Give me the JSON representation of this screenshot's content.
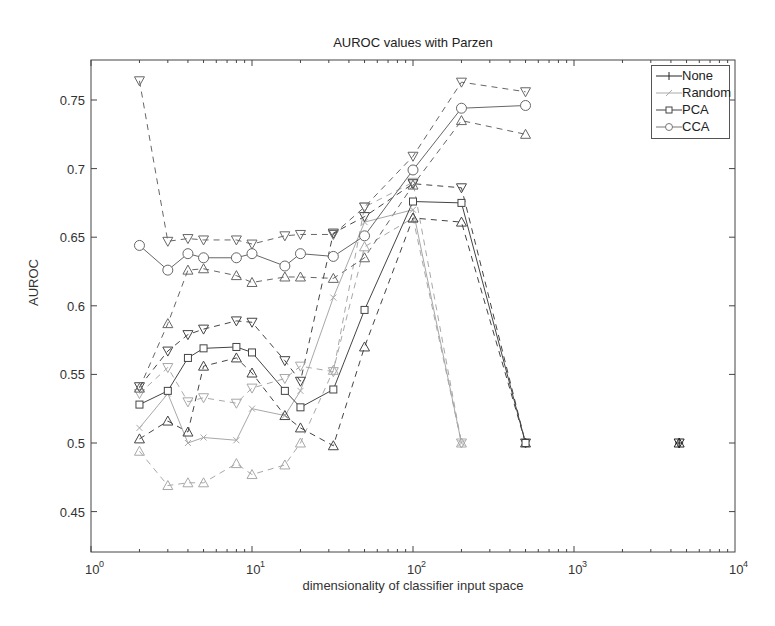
{
  "chart_data": {
    "type": "line",
    "title": "AUROC values with Parzen",
    "xlabel": "dimensionality of classifier input space",
    "ylabel": "AUROC",
    "xscale": "log",
    "xlim": [
      1,
      10000
    ],
    "ylim": [
      0.42,
      0.78
    ],
    "x_ticks": [
      1,
      10,
      100,
      1000,
      10000
    ],
    "x_tick_labels": [
      "10^0",
      "10^1",
      "10^2",
      "10^3",
      "10^4"
    ],
    "y_ticks": [
      0.45,
      0.5,
      0.55,
      0.6,
      0.65,
      0.7,
      0.75
    ],
    "y_tick_labels": [
      "0.45",
      "0.5",
      "0.55",
      "0.6",
      "0.65",
      "0.7",
      "0.75"
    ],
    "grid": false,
    "legend_position": "upper right",
    "band_style": "dashed lines; upper band marked with down-triangles, lower band with up-triangles",
    "series": [
      {
        "name": "None",
        "marker": "plus",
        "color": "#222222",
        "x": [
          4500
        ],
        "values": [
          0.5
        ],
        "upper": [
          0.5
        ],
        "lower": [
          0.5
        ]
      },
      {
        "name": "Random",
        "marker": "x",
        "color": "#a8a8a8",
        "x": [
          2,
          3,
          4,
          5,
          8,
          10,
          16,
          20,
          32,
          50,
          100,
          200
        ],
        "values": [
          0.511,
          0.536,
          0.5,
          0.504,
          0.502,
          0.525,
          0.52,
          0.538,
          0.606,
          0.661,
          0.67,
          0.5
        ],
        "upper": [
          0.536,
          0.555,
          0.53,
          0.533,
          0.529,
          0.54,
          0.547,
          0.556,
          0.552,
          0.672,
          0.69,
          0.5
        ],
        "lower": [
          0.494,
          0.469,
          0.471,
          0.471,
          0.485,
          0.477,
          0.484,
          0.5,
          0.553,
          0.643,
          0.664,
          0.5
        ]
      },
      {
        "name": "PCA",
        "marker": "square",
        "color": "#444444",
        "x": [
          2,
          3,
          4,
          5,
          8,
          10,
          16,
          20,
          32,
          50,
          100,
          200,
          500
        ],
        "values": [
          0.528,
          0.538,
          0.562,
          0.569,
          0.57,
          0.566,
          0.538,
          0.526,
          0.539,
          0.597,
          0.676,
          0.675,
          0.5
        ],
        "upper": [
          0.541,
          0.567,
          0.579,
          0.583,
          0.589,
          0.588,
          0.56,
          0.545,
          0.653,
          0.665,
          0.689,
          0.686,
          0.5
        ],
        "lower": [
          0.503,
          0.516,
          0.508,
          0.556,
          0.562,
          0.551,
          0.52,
          0.511,
          0.498,
          0.57,
          0.664,
          0.661,
          0.5
        ]
      },
      {
        "name": "CCA",
        "marker": "circle",
        "color": "#666666",
        "x": [
          2,
          3,
          4,
          5,
          8,
          10,
          16,
          20,
          32,
          50,
          100,
          200,
          500
        ],
        "values": [
          0.644,
          0.626,
          0.638,
          0.635,
          0.635,
          0.638,
          0.629,
          0.638,
          0.636,
          0.651,
          0.699,
          0.744,
          0.746
        ],
        "upper": [
          0.764,
          0.647,
          0.649,
          0.648,
          0.648,
          0.645,
          0.651,
          0.652,
          0.652,
          0.672,
          0.709,
          0.763,
          0.756
        ],
        "lower": [
          0.54,
          0.587,
          0.626,
          0.627,
          0.622,
          0.617,
          0.621,
          0.621,
          0.62,
          0.635,
          0.688,
          0.735,
          0.725
        ]
      }
    ]
  },
  "legend": {
    "items": [
      {
        "label": "None",
        "marker": "plus",
        "color": "#222222"
      },
      {
        "label": "Random",
        "marker": "x",
        "color": "#a8a8a8"
      },
      {
        "label": "PCA",
        "marker": "square",
        "color": "#444444"
      },
      {
        "label": "CCA",
        "marker": "circle",
        "color": "#666666"
      }
    ]
  }
}
